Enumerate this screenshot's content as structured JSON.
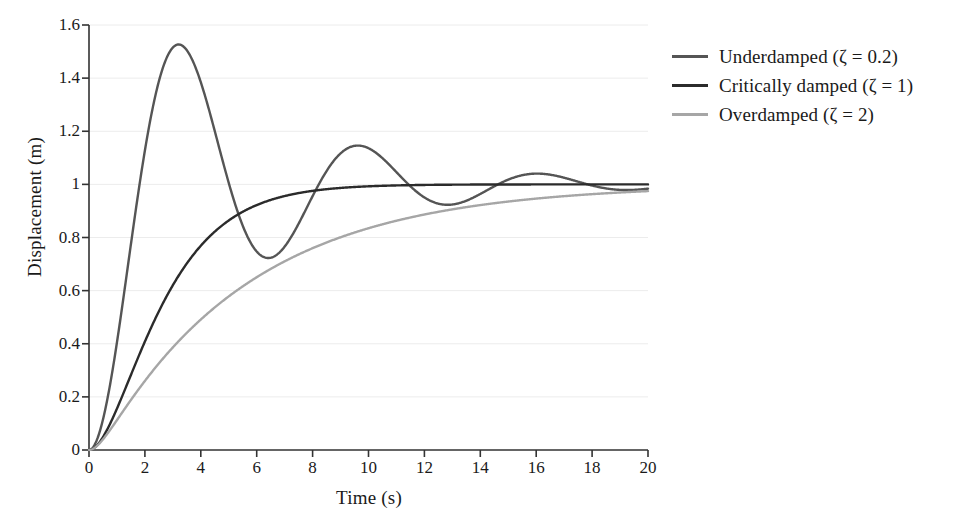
{
  "chart_data": {
    "type": "line",
    "title": "",
    "xlabel": "Time (s)",
    "ylabel": "Displacement (m)",
    "xlim": [
      0,
      20
    ],
    "ylim": [
      0,
      1.6
    ],
    "grid": "horizontal",
    "legend_position": "right-outside",
    "xticks": [
      "0",
      "2",
      "4",
      "6",
      "8",
      "10",
      "12",
      "14",
      "16",
      "18",
      "20"
    ],
    "xtick_values": [
      0,
      2,
      4,
      6,
      8,
      10,
      12,
      14,
      16,
      18,
      20
    ],
    "yticks": [
      "0",
      "0.2",
      "0.4",
      "0.6",
      "0.8",
      "1",
      "1.2",
      "1.4",
      "1.6"
    ],
    "ytick_values": [
      0,
      0.2,
      0.4,
      0.6,
      0.8,
      1,
      1.2,
      1.4,
      1.6
    ],
    "series": [
      {
        "name": "Underdamped (ζ = 0.2)",
        "color": "#555555",
        "zeta": 0.2,
        "omega_n": 1.0,
        "model": "step-response-second-order",
        "annotations": {
          "first_peak": {
            "x": 3.2,
            "y": 1.55
          },
          "first_trough": {
            "x": 6.4,
            "y": 0.71
          },
          "second_peak": {
            "x": 9.6,
            "y": 1.17
          },
          "second_trough": {
            "x": 12.8,
            "y": 0.93
          },
          "third_peak": {
            "x": 16.0,
            "y": 1.05
          },
          "final_value": 1.0
        },
        "x": [
          0,
          0.5,
          1,
          1.5,
          2,
          2.5,
          3,
          3.2,
          3.5,
          4,
          4.5,
          5,
          5.5,
          6,
          6.4,
          7,
          7.5,
          8,
          8.5,
          9,
          9.6,
          10,
          10.5,
          11,
          11.5,
          12,
          12.8,
          13.5,
          14,
          14.5,
          15,
          16,
          17,
          18,
          19,
          20
        ],
        "y": [
          0,
          0.12,
          0.43,
          0.79,
          1.1,
          1.35,
          1.5,
          1.55,
          1.52,
          1.4,
          1.2,
          0.99,
          0.83,
          0.74,
          0.71,
          0.76,
          0.86,
          0.98,
          1.08,
          1.15,
          1.17,
          1.16,
          1.12,
          1.06,
          1.0,
          0.96,
          0.93,
          0.95,
          0.97,
          1.0,
          1.02,
          1.05,
          1.02,
          0.99,
          0.98,
          0.99
        ]
      },
      {
        "name": "Critically damped (ζ = 1)",
        "color": "#2b2b2b",
        "zeta": 1,
        "omega_n": 0.7,
        "model": "step-response-second-order",
        "annotations": {
          "final_value": 1.0
        },
        "x": [
          0,
          0.5,
          1,
          1.5,
          2,
          2.5,
          3,
          3.5,
          4,
          4.5,
          5,
          6,
          7,
          8,
          9,
          10,
          12,
          14,
          16,
          18,
          20
        ],
        "y": [
          0,
          0.05,
          0.16,
          0.3,
          0.43,
          0.54,
          0.64,
          0.72,
          0.78,
          0.83,
          0.86,
          0.92,
          0.96,
          0.98,
          0.99,
          0.99,
          1.0,
          1.0,
          1.0,
          1.0,
          1.0
        ]
      },
      {
        "name": "Overdamped (ζ = 2)",
        "color": "#a6a6a6",
        "zeta": 2,
        "omega_n": 0.7,
        "model": "step-response-second-order",
        "annotations": {
          "final_value": 1.0
        },
        "x": [
          0,
          0.5,
          1,
          1.5,
          2,
          2.5,
          3,
          3.5,
          4,
          4.5,
          5,
          6,
          7,
          8,
          9,
          10,
          11,
          12,
          13,
          14,
          16,
          18,
          20
        ],
        "y": [
          0,
          0.03,
          0.09,
          0.16,
          0.24,
          0.31,
          0.38,
          0.45,
          0.51,
          0.56,
          0.61,
          0.7,
          0.77,
          0.82,
          0.86,
          0.89,
          0.92,
          0.94,
          0.95,
          0.96,
          0.98,
          0.99,
          0.99
        ]
      }
    ]
  },
  "axes": {
    "ylabel": "Displacement (m)",
    "xlabel": "Time (s)"
  },
  "legend": {
    "items": [
      {
        "label": "Underdamped (ζ = 0.2)",
        "color": "#555555"
      },
      {
        "label": "Critically damped (ζ = 1)",
        "color": "#2b2b2b"
      },
      {
        "label": "Overdamped (ζ = 2)",
        "color": "#a6a6a6"
      }
    ]
  },
  "style": {
    "axis_color": "#333333",
    "grid_color": "#ececec",
    "background": "#ffffff"
  }
}
